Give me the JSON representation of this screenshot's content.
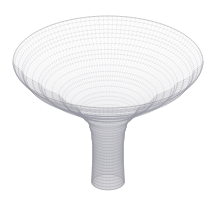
{
  "figure": {
    "title": "",
    "background_color": "#ffffff",
    "width": 216,
    "height": 197,
    "alt_text": "3D triangular wireframe mesh of a flaring funnel (trumpet / horn) surface of revolution"
  },
  "chart_data": {
    "type": "line",
    "render_style": "3d-triangular-wireframe-surface",
    "title": "",
    "subtitle": "",
    "xlabel": "",
    "ylabel": "",
    "zlabel": "",
    "legend": [],
    "legend_position": "none",
    "grid": false,
    "axes_visible": false,
    "tick_labels": [],
    "annotations": [],
    "surface": {
      "name": "funnel-of-revolution",
      "description": "Surface of revolution r(z) flaring from a narrow cylindrical stem at the bottom to a wide bell-shaped rim at the top",
      "parameterization": "x = r(v)*cos(u), y = r(v)*sin(u), z = v",
      "u_range_deg": [
        0,
        360
      ],
      "v_range": [
        0,
        1
      ],
      "u_divisions": 64,
      "v_divisions": 40,
      "profile_v": [
        0.0,
        0.1,
        0.2,
        0.3,
        0.4,
        0.5,
        0.6,
        0.7,
        0.8,
        0.9,
        1.0
      ],
      "profile_radius": [
        0.17,
        0.165,
        0.16,
        0.16,
        0.17,
        0.2,
        0.3,
        0.48,
        0.7,
        0.89,
        1.0
      ],
      "rim_radius": 1.0,
      "throat_radius": 0.16,
      "stem_radius": 0.17
    },
    "projection": {
      "type": "orthographic",
      "elevation_deg": 22,
      "azimuth_deg": 0,
      "center_x": 108,
      "rim_center_y": 62,
      "rim_radius_x": 95,
      "rim_radius_y": 46,
      "stem_bottom_y": 182,
      "stem_half_width": 20
    },
    "style": {
      "edge_color": "#b9b9bd",
      "edge_color_dense": "#9a9aa0",
      "edge_color_light": "#d8d8dc",
      "face_color": "#ffffff",
      "line_width": 0.35,
      "shading": "none"
    }
  }
}
